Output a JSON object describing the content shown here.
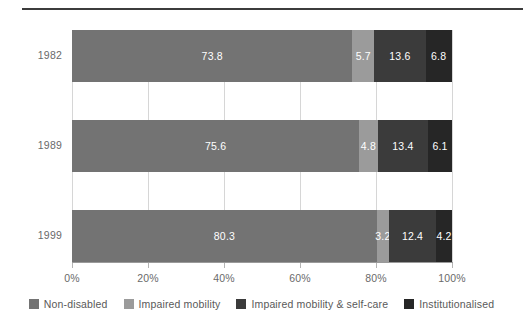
{
  "chart_data": {
    "type": "bar",
    "orientation": "horizontal",
    "stacked": true,
    "stack_mode": "percent",
    "title": "",
    "subtitle": "",
    "xlabel": "",
    "ylabel": "",
    "categories": [
      "1982",
      "1989",
      "1999"
    ],
    "xlim": [
      0,
      100
    ],
    "xticks": [
      0,
      20,
      40,
      60,
      80,
      100
    ],
    "xtick_labels": [
      "0%",
      "20%",
      "40%",
      "60%",
      "80%",
      "100%"
    ],
    "grid": true,
    "grid_axis": "x",
    "legend_position": "bottom",
    "series": [
      {
        "name": "Non-disabled",
        "color": "#737373",
        "values": [
          73.8,
          75.6,
          80.3
        ],
        "labels": [
          "73.8",
          "75.6",
          "80.3"
        ]
      },
      {
        "name": "Impaired mobility",
        "color": "#9b9b9b",
        "values": [
          5.7,
          4.8,
          3.2
        ],
        "labels": [
          "5.7",
          "4.8",
          "3.2"
        ]
      },
      {
        "name": "Impaired mobility & self-care",
        "color": "#3b3b3b",
        "values": [
          13.6,
          13.4,
          12.4
        ],
        "labels": [
          "13.6",
          "13.4",
          "12.4"
        ]
      },
      {
        "name": "Institutionalised",
        "color": "#262626",
        "values": [
          6.8,
          6.1,
          4.2
        ],
        "labels": [
          "6.8",
          "6.1",
          "4.2"
        ]
      }
    ]
  },
  "axis": {
    "x_tick_labels": [
      "0%",
      "20%",
      "40%",
      "60%",
      "80%",
      "100%"
    ],
    "y_tick_labels": [
      "1982",
      "1989",
      "1999"
    ]
  },
  "legend": {
    "items": [
      {
        "label": "Non-disabled",
        "color": "#737373"
      },
      {
        "label": "Impaired mobility",
        "color": "#9b9b9b"
      },
      {
        "label": "Impaired mobility & self-care",
        "color": "#3b3b3b"
      },
      {
        "label": "Institutionalised",
        "color": "#262626"
      }
    ]
  },
  "colors": {
    "rule": "#3c3c3c",
    "gridline": "#d6d6d6",
    "axis": "#9a9a9a",
    "text": "#6a6a6a",
    "bar_label_text": "#ffffff",
    "background": "#ffffff"
  }
}
